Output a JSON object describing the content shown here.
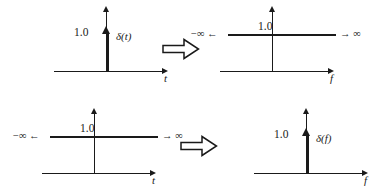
{
  "figure": {
    "colors": {
      "ink": "#1a1a1a",
      "background": "#ffffff"
    },
    "relation_symbol": "implies-double-arrow",
    "rows": [
      {
        "id": "row-impulse-to-constant",
        "left": {
          "id": "panel-delta-t",
          "kind": "impulse",
          "amplitude_label": "1.0",
          "function_label": "δ(t)",
          "axis_label": "t",
          "left_infinity_label": "",
          "right_infinity_label": ""
        },
        "right": {
          "id": "panel-constant-f",
          "kind": "constant",
          "amplitude_label": "1.0",
          "function_label": "",
          "axis_label": "f",
          "left_infinity_label": "−∞ ←",
          "right_infinity_label": "→ ∞"
        }
      },
      {
        "id": "row-constant-to-impulse",
        "left": {
          "id": "panel-constant-t",
          "kind": "constant",
          "amplitude_label": "1.0",
          "function_label": "",
          "axis_label": "t",
          "left_infinity_label": "−∞ ←",
          "right_infinity_label": "→ ∞"
        },
        "right": {
          "id": "panel-delta-f",
          "kind": "impulse",
          "amplitude_label": "1.0",
          "function_label": "δ(f)",
          "axis_label": "f",
          "left_infinity_label": "",
          "right_infinity_label": ""
        }
      }
    ]
  }
}
